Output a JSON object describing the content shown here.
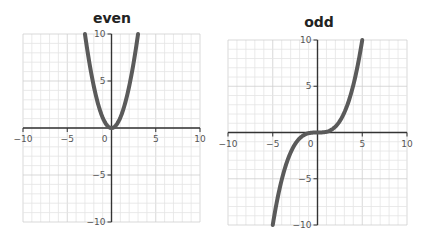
{
  "chart_data": [
    {
      "type": "line",
      "title": "even",
      "xlabel": "",
      "ylabel": "",
      "xlim": [
        -10,
        10
      ],
      "ylim": [
        -10,
        10
      ],
      "xticks": [
        -10,
        -5,
        0,
        5,
        10
      ],
      "yticks": [
        -10,
        -5,
        5,
        10
      ],
      "grid": true,
      "series": [
        {
          "name": "even function (parabola)",
          "x": [
            -3,
            -2.5,
            -2,
            -1.5,
            -1,
            -0.5,
            0,
            0.5,
            1,
            1.5,
            2,
            2.5,
            3
          ],
          "y": [
            10,
            6.9,
            4.4,
            2.5,
            1.1,
            0.3,
            0,
            0.3,
            1.1,
            2.5,
            4.4,
            6.9,
            10
          ]
        }
      ]
    },
    {
      "type": "line",
      "title": "odd",
      "xlabel": "",
      "ylabel": "",
      "xlim": [
        -10,
        10
      ],
      "ylim": [
        -10,
        10
      ],
      "xticks": [
        -10,
        -5,
        0,
        5,
        10
      ],
      "yticks": [
        -10,
        -5,
        5,
        10
      ],
      "grid": true,
      "series": [
        {
          "name": "odd function (cubic)",
          "x": [
            -5,
            -4,
            -3,
            -2,
            -1,
            0,
            1,
            2,
            3,
            4,
            5
          ],
          "y": [
            -10,
            -5.1,
            -2.2,
            -0.6,
            -0.1,
            0,
            0.1,
            0.6,
            2.2,
            5.1,
            10
          ]
        }
      ]
    }
  ],
  "labels": {
    "left_title": "even",
    "right_title": "odd",
    "tick_neg10": "−10",
    "tick_neg5": "−5",
    "tick_0": "0",
    "tick_5": "5",
    "tick_10": "10"
  },
  "colors": {
    "curve": "#5a5a5a",
    "axis": "#333333",
    "grid_minor": "#e4e4e4",
    "grid_major": "#cfcfcf",
    "tick_text": "#555555"
  }
}
